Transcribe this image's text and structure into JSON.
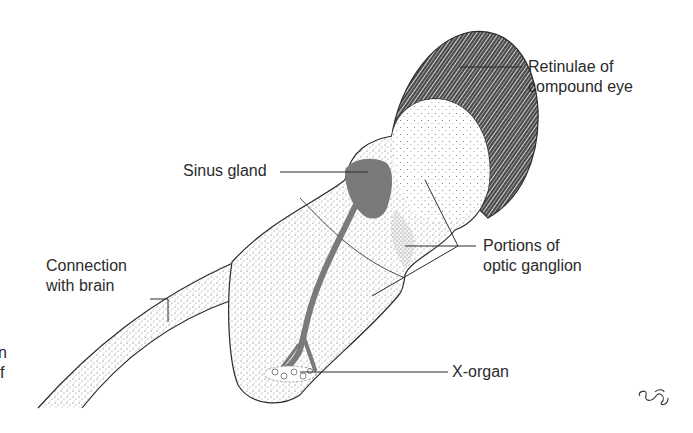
{
  "diagram": {
    "type": "anatomical illustration",
    "labels": {
      "retinulae": [
        "Retinulae of",
        "compound eye"
      ],
      "sinus_gland": "Sinus gland",
      "optic_ganglion": [
        "Portions of",
        "optic ganglion"
      ],
      "connection": [
        "Connection",
        "with brain"
      ],
      "x_organ": "X-organ"
    },
    "cropped_text_fragments": [
      "n",
      "f"
    ],
    "signature": "artist signature",
    "colors": {
      "ink": "#2b2b2b",
      "gland_fill": "#7a7a7a",
      "retina_dark": "#3a3a3a",
      "background": "#ffffff"
    }
  }
}
